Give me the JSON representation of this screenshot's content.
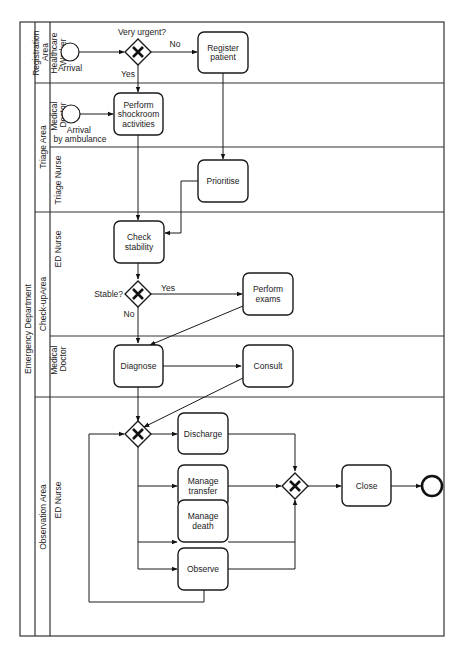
{
  "pool": {
    "label": "Emergency Department"
  },
  "lane_groups": [
    {
      "label_lines": [
        "Registration",
        "Area"
      ]
    },
    {
      "label_lines": [
        "Triage Area"
      ]
    },
    {
      "label_lines": [
        "Check-upArea"
      ]
    },
    {
      "label_lines": [
        "Observation Area"
      ]
    }
  ],
  "lanes": [
    {
      "label_lines": [
        "Healthcare",
        "Worker"
      ]
    },
    {
      "label_lines": [
        "Medical",
        "Doctor"
      ]
    },
    {
      "label_lines": [
        "Triage Nurse"
      ]
    },
    {
      "label_lines": [
        "ED Nurse"
      ]
    },
    {
      "label_lines": [
        "Medical",
        "Doctor"
      ]
    },
    {
      "label_lines": [
        "ED Nurse"
      ]
    }
  ],
  "events": {
    "start_arrival": {
      "label": "Arrival"
    },
    "start_ambulance": {
      "label_lines": [
        "Arrival",
        "by ambulance"
      ]
    },
    "end": {
      "label": ""
    }
  },
  "gateways": {
    "urgent": {
      "label": "Very urgent?",
      "yes": "Yes",
      "no": "No"
    },
    "stable": {
      "label": "Stable?",
      "yes": "Yes",
      "no": "No"
    }
  },
  "tasks": {
    "register": {
      "lines": [
        "Register",
        "patient"
      ]
    },
    "shockroom": {
      "lines": [
        "Perform",
        "shockroom",
        "activities"
      ]
    },
    "prioritise": {
      "lines": [
        "Prioritise"
      ]
    },
    "check": {
      "lines": [
        "Check",
        "stability"
      ]
    },
    "exams": {
      "lines": [
        "Perform",
        "exams"
      ]
    },
    "diagnose": {
      "lines": [
        "Diagnose"
      ]
    },
    "consult": {
      "lines": [
        "Consult"
      ]
    },
    "discharge": {
      "lines": [
        "Discharge"
      ]
    },
    "transfer": {
      "lines": [
        "Manage",
        "transfer"
      ]
    },
    "death": {
      "lines": [
        "Manage",
        "death"
      ]
    },
    "observe": {
      "lines": [
        "Observe"
      ]
    },
    "close": {
      "lines": [
        "Close"
      ]
    }
  }
}
